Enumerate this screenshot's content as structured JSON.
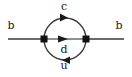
{
  "figure": {
    "type": "feynman-diagram",
    "background_color": "#ffffff",
    "line_color": "#555555",
    "loop_color": "#3a3a3a",
    "vertex_color": "#111111",
    "text_color": "#1a1a1a"
  },
  "labels": {
    "incoming_left": "b",
    "outgoing_right": "b",
    "upper_arc": "c",
    "middle_line": "d",
    "lower_arc": "u"
  },
  "geometry": {
    "canvas_width": 132,
    "canvas_height": 77,
    "baseline_y": 39,
    "vertex_left_x": 44,
    "vertex_right_x": 86,
    "vertex_size": 7,
    "loop_center_x": 65,
    "loop_radius": 21,
    "line_start_x": 8,
    "line_end_x": 124
  },
  "arrows": {
    "upper_arc_direction": "right",
    "middle_line_direction": "right",
    "lower_arc_direction": "left"
  }
}
